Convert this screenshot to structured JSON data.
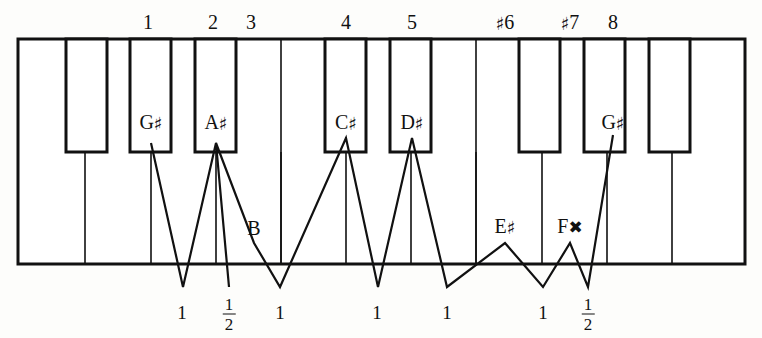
{
  "figure": {
    "kind": "piano-keyboard-interval-diagram",
    "ink_color": "#111111",
    "white_key_color": "#ffffff",
    "black_key_color": "#ffffff",
    "background_color": "#fdfdfb"
  },
  "keyboard": {
    "left": 18,
    "right": 745,
    "top": 39,
    "bottom": 264,
    "black_key_bottom": 152,
    "outline_stroke": 3,
    "divider_stroke": 1.6,
    "white_key_dividers": [
      85,
      151,
      216,
      281,
      346,
      411,
      476,
      542,
      607,
      672
    ],
    "black_keys": [
      {
        "name": "black-key-1",
        "x": 66,
        "width": 41,
        "label": ""
      },
      {
        "name": "black-key-2",
        "x": 130,
        "width": 41,
        "label": "G♯"
      },
      {
        "name": "black-key-3",
        "x": 195,
        "width": 41,
        "label": "A♯"
      },
      {
        "name": "black-key-4",
        "x": 325,
        "width": 41,
        "label": "C♯"
      },
      {
        "name": "black-key-5",
        "x": 390,
        "width": 41,
        "label": "D♯"
      },
      {
        "name": "black-key-6",
        "x": 519,
        "width": 41,
        "label": ""
      },
      {
        "name": "black-key-7",
        "x": 584,
        "width": 41,
        "label": ""
      },
      {
        "name": "black-key-8",
        "x": 649,
        "width": 41,
        "label": ""
      }
    ]
  },
  "degree_labels": [
    {
      "text": "1",
      "accidental": "",
      "x": 148,
      "y": 22
    },
    {
      "text": "2",
      "accidental": "",
      "x": 213,
      "y": 22
    },
    {
      "text": "3",
      "accidental": "",
      "x": 251,
      "y": 22
    },
    {
      "text": "4",
      "accidental": "",
      "x": 346,
      "y": 22
    },
    {
      "text": "5",
      "accidental": "",
      "x": 412,
      "y": 22
    },
    {
      "text": "6",
      "accidental": "♯",
      "x": 505,
      "y": 22
    },
    {
      "text": "7",
      "accidental": "♯",
      "x": 570,
      "y": 22
    },
    {
      "text": "8",
      "accidental": "",
      "x": 613,
      "y": 22
    }
  ],
  "note_labels": [
    {
      "text": "G",
      "accidental": "♯",
      "x": 151,
      "y": 122,
      "on": "black-key"
    },
    {
      "text": "A",
      "accidental": "♯",
      "x": 216,
      "y": 122,
      "on": "black-key"
    },
    {
      "text": "C",
      "accidental": "♯",
      "x": 346,
      "y": 122,
      "on": "black-key"
    },
    {
      "text": "D",
      "accidental": "♯",
      "x": 412,
      "y": 122,
      "on": "black-key"
    },
    {
      "text": "B",
      "accidental": "",
      "x": 254,
      "y": 228,
      "on": "white-key"
    },
    {
      "text": "E",
      "accidental": "♯",
      "x": 505,
      "y": 226,
      "on": "white-key"
    },
    {
      "text": "F",
      "accidental": "✖",
      "x": 570,
      "y": 226,
      "on": "white-key"
    },
    {
      "text": "G",
      "accidental": "♯",
      "x": 613,
      "y": 122,
      "on": "black-key"
    }
  ],
  "step_labels": [
    {
      "whole": "1",
      "numerator": "",
      "denominator": "",
      "x": 182,
      "y": 312
    },
    {
      "whole": "",
      "numerator": "1",
      "denominator": "2",
      "x": 229,
      "y": 312
    },
    {
      "whole": "1",
      "numerator": "",
      "denominator": "",
      "x": 280,
      "y": 312
    },
    {
      "whole": "1",
      "numerator": "",
      "denominator": "",
      "x": 377,
      "y": 312
    },
    {
      "whole": "1",
      "numerator": "",
      "denominator": "",
      "x": 447,
      "y": 312
    },
    {
      "whole": "1",
      "numerator": "",
      "denominator": "",
      "x": 543,
      "y": 312
    },
    {
      "whole": "",
      "numerator": "1",
      "denominator": "2",
      "x": 588,
      "y": 312
    }
  ],
  "zigzag": {
    "stroke": 2.2,
    "points": "151,143 183,287 216,143 229,287 216,143 254,243 280,287 346,138 280,287 346,138 378,287 412,138 378,287 412,138 447,287 505,243 543,287 570,243 588,287 613,135"
  }
}
